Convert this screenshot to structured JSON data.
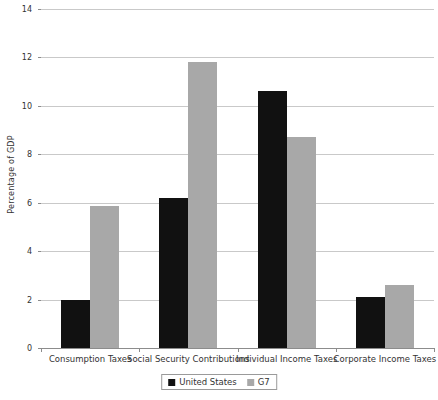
{
  "chart_data": {
    "type": "bar",
    "title": "",
    "xlabel": "",
    "ylabel": "Percentage of GDP",
    "ylim": [
      0,
      14
    ],
    "ytick_step": 2,
    "yticks": [
      "0",
      "2",
      "4",
      "6",
      "8",
      "10",
      "12",
      "14"
    ],
    "grid": true,
    "legend_position": "bottom-center",
    "categories": [
      "Consumption Taxes",
      "Social Security Contributions",
      "Individual Income Taxes",
      "Corporate Income Taxes"
    ],
    "series": [
      {
        "name": "United States",
        "color": "#111111",
        "values": [
          2.0,
          6.2,
          10.6,
          2.1
        ]
      },
      {
        "name": "G7",
        "color": "#a8a8a8",
        "values": [
          5.85,
          11.8,
          8.7,
          2.6
        ]
      }
    ]
  },
  "legend": {
    "items": [
      {
        "label": "United States",
        "swatch": "black-square-swatch"
      },
      {
        "label": "G7",
        "swatch": "gray-square-swatch"
      }
    ]
  },
  "colors": {
    "series_us": "#111111",
    "series_g7": "#a8a8a8",
    "gridline": "#c9c9c9",
    "axis": "#8c8c8c",
    "background": "#ffffff",
    "text": "#333333"
  }
}
